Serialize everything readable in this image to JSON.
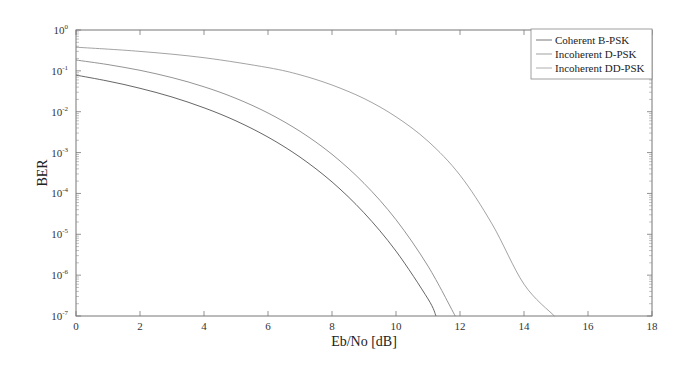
{
  "chart_data": {
    "type": "line",
    "title": "",
    "xlabel": "Eb/No [dB]",
    "ylabel": "BER",
    "xlim": [
      0,
      18
    ],
    "ylim": [
      1e-07,
      1
    ],
    "yscale": "log",
    "grid": false,
    "legend_position": "upper right",
    "x_ticks": [
      0,
      2,
      4,
      6,
      8,
      10,
      12,
      14,
      16,
      18
    ],
    "y_ticks": [
      "10^0",
      "10^-1",
      "10^-2",
      "10^-3",
      "10^-4",
      "10^-5",
      "10^-6",
      "10^-7"
    ],
    "series": [
      {
        "name": "Coherent B-PSK",
        "color": "#555555",
        "x": [
          0,
          1,
          2,
          3,
          4,
          5,
          6,
          7,
          8,
          9,
          10,
          11,
          11.25
        ],
        "values": [
          0.0786,
          0.0563,
          0.0375,
          0.0229,
          0.0125,
          0.00595,
          0.00239,
          0.000773,
          0.000191,
          3.36e-05,
          3.87e-06,
          2.62e-07,
          1e-07
        ]
      },
      {
        "name": "Incoherent D-PSK",
        "color": "#888888",
        "x": [
          0,
          1,
          2,
          3,
          4,
          5,
          6,
          7,
          8,
          9,
          10,
          11,
          11.85
        ],
        "values": [
          0.184,
          0.142,
          0.103,
          0.0684,
          0.0408,
          0.0212,
          0.00928,
          0.00331,
          0.000906,
          0.000177,
          2.27e-05,
          1.66e-06,
          1e-07
        ]
      },
      {
        "name": "Incoherent DD-PSK",
        "color": "#999999",
        "x": [
          0,
          2,
          4,
          6,
          7,
          8,
          9,
          10,
          11,
          12,
          13,
          14,
          14.95
        ],
        "values": [
          0.38,
          0.3,
          0.21,
          0.12,
          0.08,
          0.045,
          0.021,
          0.0075,
          0.0019,
          0.00028,
          1.8e-05,
          6e-07,
          1e-07
        ]
      }
    ]
  },
  "legend": {
    "items": [
      "Coherent B-PSK",
      "Incoherent D-PSK",
      "Incoherent DD-PSK"
    ]
  },
  "axes": {
    "x_title": "Eb/No [dB]",
    "y_title": "BER",
    "x_tick_labels": [
      "0",
      "2",
      "4",
      "6",
      "8",
      "10",
      "12",
      "14",
      "16",
      "18"
    ],
    "y_tick_exponents": [
      "0",
      "-1",
      "-2",
      "-3",
      "-4",
      "-5",
      "-6",
      "-7"
    ]
  }
}
